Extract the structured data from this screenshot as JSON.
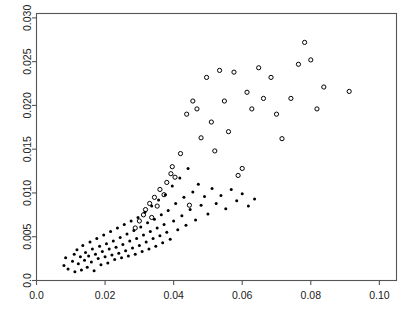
{
  "chart_data": {
    "type": "scatter",
    "title": "",
    "subtitle": "",
    "xlabel": "",
    "ylabel": "",
    "xlim": [
      0.0,
      0.105
    ],
    "ylim": [
      0.0,
      0.0305
    ],
    "xticks": [
      0.0,
      0.02,
      0.04,
      0.06,
      0.08,
      0.1
    ],
    "xticklabels": [
      "0.0",
      "0.02",
      "0.04",
      "0.06",
      "0.08",
      "0.10"
    ],
    "yticks": [
      0.0,
      0.005,
      0.01,
      0.015,
      0.02,
      0.025,
      0.03
    ],
    "yticklabels": [
      "0.0",
      "0.005",
      "0.010",
      "0.015",
      "0.020",
      "0.025",
      "0.030"
    ],
    "grid": false,
    "legend": "none",
    "frame": true,
    "y_axis_label_rotation": -90,
    "marker_colors": {
      "filled": "#000000",
      "open": "#000000"
    },
    "series": [
      {
        "name": "filled-points",
        "marker": "filled-circle",
        "marker_size": 3.0,
        "points": [
          [
            0.008,
            0.0017
          ],
          [
            0.0085,
            0.0026
          ],
          [
            0.0092,
            0.0013
          ],
          [
            0.0105,
            0.0022
          ],
          [
            0.011,
            0.003
          ],
          [
            0.0112,
            0.001
          ],
          [
            0.0118,
            0.0035
          ],
          [
            0.0122,
            0.0019
          ],
          [
            0.0128,
            0.0027
          ],
          [
            0.0131,
            0.0012
          ],
          [
            0.0135,
            0.004
          ],
          [
            0.014,
            0.0023
          ],
          [
            0.0143,
            0.0032
          ],
          [
            0.0148,
            0.0015
          ],
          [
            0.0152,
            0.0028
          ],
          [
            0.0156,
            0.0044
          ],
          [
            0.016,
            0.0021
          ],
          [
            0.0163,
            0.0036
          ],
          [
            0.0168,
            0.0011
          ],
          [
            0.0172,
            0.003
          ],
          [
            0.0176,
            0.0048
          ],
          [
            0.018,
            0.0025
          ],
          [
            0.0184,
            0.0039
          ],
          [
            0.0188,
            0.0018
          ],
          [
            0.0192,
            0.0033
          ],
          [
            0.0196,
            0.0052
          ],
          [
            0.02,
            0.0027
          ],
          [
            0.0204,
            0.0042
          ],
          [
            0.0208,
            0.002
          ],
          [
            0.0212,
            0.0036
          ],
          [
            0.0216,
            0.0056
          ],
          [
            0.022,
            0.0029
          ],
          [
            0.0224,
            0.0045
          ],
          [
            0.0228,
            0.0024
          ],
          [
            0.0232,
            0.0038
          ],
          [
            0.0236,
            0.006
          ],
          [
            0.024,
            0.0031
          ],
          [
            0.0244,
            0.0049
          ],
          [
            0.0248,
            0.0026
          ],
          [
            0.0252,
            0.0041
          ],
          [
            0.0256,
            0.0064
          ],
          [
            0.026,
            0.0034
          ],
          [
            0.0264,
            0.0053
          ],
          [
            0.0268,
            0.0028
          ],
          [
            0.0272,
            0.0045
          ],
          [
            0.0276,
            0.0068
          ],
          [
            0.028,
            0.0037
          ],
          [
            0.0284,
            0.0057
          ],
          [
            0.0288,
            0.003
          ],
          [
            0.0292,
            0.0048
          ],
          [
            0.0296,
            0.0072
          ],
          [
            0.03,
            0.004
          ],
          [
            0.0304,
            0.0061
          ],
          [
            0.0308,
            0.0033
          ],
          [
            0.0312,
            0.0052
          ],
          [
            0.0316,
            0.0078
          ],
          [
            0.032,
            0.0044
          ],
          [
            0.0324,
            0.0066
          ],
          [
            0.0328,
            0.0036
          ],
          [
            0.0332,
            0.0056
          ],
          [
            0.0336,
            0.0085
          ],
          [
            0.034,
            0.0048
          ],
          [
            0.0344,
            0.007
          ],
          [
            0.0348,
            0.0039
          ],
          [
            0.0352,
            0.006
          ],
          [
            0.0356,
            0.0092
          ],
          [
            0.036,
            0.0051
          ],
          [
            0.0364,
            0.0075
          ],
          [
            0.0368,
            0.0043
          ],
          [
            0.0372,
            0.0064
          ],
          [
            0.0376,
            0.0098
          ],
          [
            0.038,
            0.0055
          ],
          [
            0.0384,
            0.008
          ],
          [
            0.039,
            0.0047
          ],
          [
            0.0396,
            0.0108
          ],
          [
            0.04,
            0.0068
          ],
          [
            0.0406,
            0.0088
          ],
          [
            0.0412,
            0.0058
          ],
          [
            0.0418,
            0.0117
          ],
          [
            0.0424,
            0.0074
          ],
          [
            0.043,
            0.0095
          ],
          [
            0.0436,
            0.0063
          ],
          [
            0.0442,
            0.0128
          ],
          [
            0.0448,
            0.0081
          ],
          [
            0.0456,
            0.0101
          ],
          [
            0.0464,
            0.0069
          ],
          [
            0.0472,
            0.011
          ],
          [
            0.048,
            0.0086
          ],
          [
            0.049,
            0.0096
          ],
          [
            0.05,
            0.0076
          ],
          [
            0.0512,
            0.0105
          ],
          [
            0.0524,
            0.0088
          ],
          [
            0.0538,
            0.0097
          ],
          [
            0.0552,
            0.0082
          ],
          [
            0.0568,
            0.0104
          ],
          [
            0.0584,
            0.0091
          ],
          [
            0.06,
            0.0099
          ],
          [
            0.0618,
            0.0085
          ],
          [
            0.0636,
            0.0093
          ]
        ]
      },
      {
        "name": "open-points",
        "marker": "open-circle",
        "marker_size": 4.2,
        "points": [
          [
            0.0288,
            0.006
          ],
          [
            0.03,
            0.0068
          ],
          [
            0.0312,
            0.0075
          ],
          [
            0.0318,
            0.0081
          ],
          [
            0.033,
            0.0088
          ],
          [
            0.0336,
            0.0072
          ],
          [
            0.0344,
            0.0095
          ],
          [
            0.0352,
            0.0085
          ],
          [
            0.036,
            0.0104
          ],
          [
            0.0372,
            0.0098
          ],
          [
            0.038,
            0.0112
          ],
          [
            0.0392,
            0.0122
          ],
          [
            0.0396,
            0.013
          ],
          [
            0.0404,
            0.0118
          ],
          [
            0.042,
            0.0145
          ],
          [
            0.0438,
            0.019
          ],
          [
            0.0446,
            0.0086
          ],
          [
            0.0456,
            0.0205
          ],
          [
            0.0468,
            0.0196
          ],
          [
            0.048,
            0.0163
          ],
          [
            0.0496,
            0.0232
          ],
          [
            0.051,
            0.0181
          ],
          [
            0.052,
            0.0148
          ],
          [
            0.0534,
            0.024
          ],
          [
            0.0548,
            0.0205
          ],
          [
            0.056,
            0.017
          ],
          [
            0.0576,
            0.0238
          ],
          [
            0.0588,
            0.012
          ],
          [
            0.06,
            0.0128
          ],
          [
            0.0614,
            0.0215
          ],
          [
            0.0628,
            0.0196
          ],
          [
            0.0648,
            0.0243
          ],
          [
            0.0662,
            0.0208
          ],
          [
            0.0684,
            0.0232
          ],
          [
            0.07,
            0.019
          ],
          [
            0.0716,
            0.0162
          ],
          [
            0.0742,
            0.0208
          ],
          [
            0.0764,
            0.0247
          ],
          [
            0.0782,
            0.0272
          ],
          [
            0.08,
            0.0252
          ],
          [
            0.0818,
            0.0196
          ],
          [
            0.0838,
            0.0221
          ],
          [
            0.0912,
            0.0216
          ]
        ]
      }
    ]
  }
}
